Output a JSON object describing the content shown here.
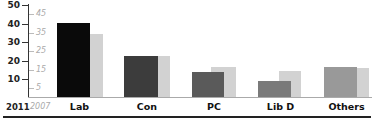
{
  "chart_data": {
    "type": "bar",
    "title": "",
    "xlabel": "",
    "ylabel": "",
    "categories": [
      "Lab",
      "Con",
      "PC",
      "Lib D",
      "Others"
    ],
    "series": [
      {
        "name": "2011",
        "values": [
          40,
          22,
          13.5,
          8.5,
          16
        ],
        "colors": [
          "#0a0a0a",
          "#3c3c3c",
          "#5a5a5a",
          "#7a7a7a",
          "#999999"
        ]
      },
      {
        "name": "2007",
        "values": [
          34,
          22,
          16,
          14,
          15.5
        ],
        "color": "#d2d2d2"
      }
    ],
    "ylim": [
      0,
      50
    ],
    "y_ticks_2011": [
      "50",
      "40",
      "30",
      "20",
      "10"
    ],
    "y_ticks_2007": [
      "45",
      "35",
      "25",
      "15",
      "5"
    ],
    "grid": false,
    "legend": {
      "position": "bottom-left",
      "entries": [
        "2011",
        "2007"
      ]
    }
  },
  "axis": {
    "ticks_2011": [
      {
        "label": "50",
        "y": 5
      },
      {
        "label": "40",
        "y": 24
      },
      {
        "label": "30",
        "y": 42
      },
      {
        "label": "20",
        "y": 61
      },
      {
        "label": "10",
        "y": 79
      }
    ],
    "ticks_2007": [
      {
        "label": "45",
        "y": 14
      },
      {
        "label": "35",
        "y": 33
      },
      {
        "label": "25",
        "y": 51
      },
      {
        "label": "15",
        "y": 70
      },
      {
        "label": "5",
        "y": 88
      }
    ]
  },
  "legend": {
    "label_2011": "2011",
    "label_2007": "2007"
  },
  "categories": [
    {
      "label": "Lab",
      "x2011": 57,
      "w2011": 33,
      "v2011": 40,
      "c2011": "#0a0a0a",
      "x2007": 90,
      "w2007": 13,
      "v2007": 34
    },
    {
      "label": "Con",
      "x2011": 124,
      "w2011": 34,
      "v2011": 22,
      "c2011": "#3c3c3c",
      "x2007": 158,
      "w2007": 12,
      "v2007": 22
    },
    {
      "label": "PC",
      "x2011": 192,
      "w2011": 32,
      "v2011": 13.5,
      "c2011": "#5a5a5a",
      "x2007": 211,
      "w2007": 25,
      "v2007": 16
    },
    {
      "label": "Lib D",
      "x2011": 258,
      "w2011": 33,
      "v2011": 8.5,
      "c2011": "#7a7a7a",
      "x2007": 279,
      "w2007": 22,
      "v2007": 14
    },
    {
      "label": "Others",
      "x2011": 324,
      "w2011": 33,
      "v2011": 16,
      "c2011": "#999999",
      "x2007": 357,
      "w2007": 12,
      "v2007": 15.5
    }
  ],
  "colors": {
    "c2007": "#d2d2d2"
  }
}
